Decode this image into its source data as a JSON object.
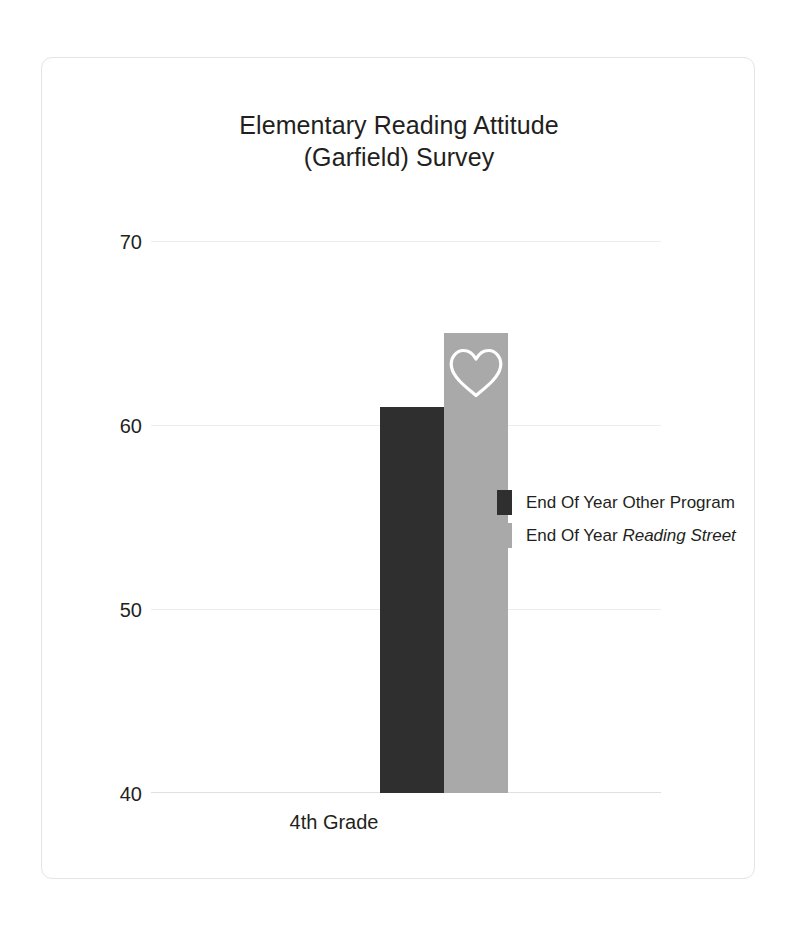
{
  "card": {
    "background": "#ffffff",
    "border_color": "#e4e4e4"
  },
  "chart_data": {
    "type": "bar",
    "title": "Elementary Reading Attitude (Garfield) Survey",
    "title_line_1": "Elementary Reading Attitude",
    "title_line_2": "(Garfield) Survey",
    "xlabel": "",
    "ylabel": "",
    "categories": [
      "4th Grade"
    ],
    "series": [
      {
        "name": "End Of Year Other Program",
        "name_prefix": "End Of Year Other Program",
        "name_italic": "",
        "values": [
          61
        ],
        "color": "#2f2f2f"
      },
      {
        "name": "End Of Year Reading Street",
        "name_prefix": "End Of Year ",
        "name_italic": "Reading Street",
        "values": [
          65
        ],
        "color": "#a9a9a9"
      }
    ],
    "ylim": [
      40,
      70
    ],
    "yticks": [
      40,
      50,
      60,
      70
    ],
    "ytick_labels": [
      "40",
      "50",
      "60",
      "70"
    ],
    "grid": true,
    "legend_position": "right-middle",
    "annotations": [
      {
        "name": "heart-icon",
        "on_series": "End Of Year Reading Street",
        "color": "#ffffff",
        "style": "outline"
      }
    ]
  },
  "axis": {
    "y_labels": [
      "70",
      "60",
      "50",
      "40"
    ],
    "x_category_label": "4th Grade"
  },
  "legend": {
    "items": [
      {
        "label_prefix": "End Of Year Other Program",
        "label_italic": "",
        "swatch": "#2f2f2f"
      },
      {
        "label_prefix": "End Of Year ",
        "label_italic": "Reading Street",
        "swatch": "#a9a9a9"
      }
    ]
  }
}
